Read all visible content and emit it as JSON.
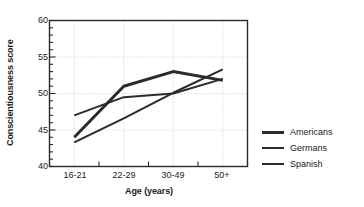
{
  "chart_data": {
    "type": "line",
    "title": "",
    "xlabel": "Age (years)",
    "ylabel": "Conscientiousness score",
    "categories": [
      "16-21",
      "22-29",
      "30-49",
      "50+"
    ],
    "ylim": [
      40,
      60
    ],
    "yticks": [
      40,
      45,
      50,
      55,
      60
    ],
    "ytick_labels": [
      "40",
      "45",
      "50",
      "55",
      "60"
    ],
    "grid": true,
    "grid_style": "dotted",
    "grid_color": "#cccccc",
    "legend_position": "right",
    "series": [
      {
        "name": "Americans",
        "color": "#2b2b2b",
        "line_width": 3,
        "values": [
          44.0,
          51.0,
          53.0,
          51.8
        ]
      },
      {
        "name": "Germans",
        "color": "#2b2b2b",
        "line_width": 2,
        "values": [
          47.0,
          49.5,
          50.0,
          52.0
        ]
      },
      {
        "name": "Spanish",
        "color": "#2b2b2b",
        "line_width": 2,
        "values": [
          43.3,
          46.6,
          50.1,
          53.3
        ]
      }
    ]
  },
  "legend": {
    "entries": [
      {
        "label": "Americans"
      },
      {
        "label": "Germans"
      },
      {
        "label": "Spanish"
      }
    ]
  }
}
